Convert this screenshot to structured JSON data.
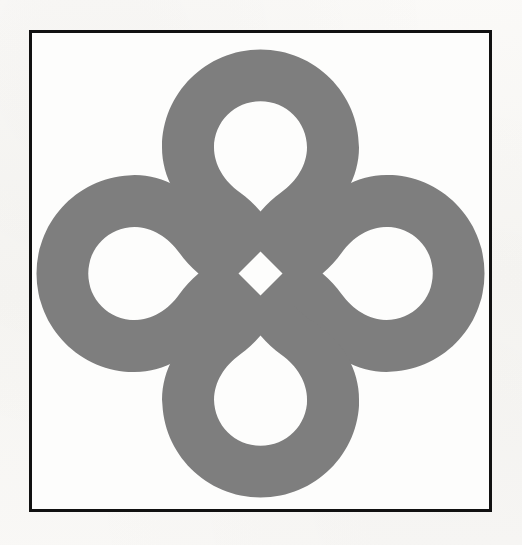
{
  "page": {
    "kind": "scanned-figure-page",
    "background_color": "#f8f7f5",
    "width": 522,
    "height": 545
  },
  "frame": {
    "name": "figure-border",
    "stroke_color": "#111111",
    "stroke_width": 3,
    "fill_color": "#fdfdfc",
    "left": 29,
    "top": 30,
    "width": 463,
    "height": 482
  },
  "figure": {
    "name": "celtic-bowen-knot",
    "fill_color": "#7e7e7e",
    "hole_color": "#fdfdfc",
    "center_x": 260,
    "center_y": 272,
    "band_thickness": 48,
    "lobe_count": 4,
    "bounds": {
      "left": 52,
      "top": 48,
      "right": 465,
      "bottom": 488
    },
    "center_diamond": {
      "name": "center-diamond-hole",
      "width": 44,
      "height": 44
    },
    "lobes": [
      {
        "name": "top-lobe",
        "direction": "up",
        "outer_extent": 48
      },
      {
        "name": "right-lobe",
        "direction": "right",
        "outer_extent": 465
      },
      {
        "name": "bottom-lobe",
        "direction": "down",
        "outer_extent": 488
      },
      {
        "name": "left-lobe",
        "direction": "left",
        "outer_extent": 52
      }
    ]
  }
}
